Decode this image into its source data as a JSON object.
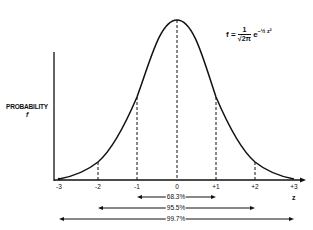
{
  "diagram": {
    "y_axis_label": "PROBABILITY",
    "y_axis_symbol": "f",
    "x_axis_symbol": "z",
    "formula": {
      "lhs": "f =",
      "numerator": "1",
      "denominator": "√2π",
      "base": "e",
      "exponent": "−½ z²"
    },
    "ticks": [
      {
        "label": "-3",
        "x": 59
      },
      {
        "label": "-2",
        "x": 98
      },
      {
        "label": "-1",
        "x": 137
      },
      {
        "label": "0",
        "x": 177
      },
      {
        "label": "+1",
        "x": 216
      },
      {
        "label": "+2",
        "x": 255
      },
      {
        "label": "+3",
        "x": 294
      }
    ],
    "ranges": [
      {
        "label": "68.3%",
        "from": "-1",
        "to": "+1"
      },
      {
        "label": "95.5%",
        "from": "-2",
        "to": "+2"
      },
      {
        "label": "99.7%",
        "from": "-3",
        "to": "+3"
      }
    ],
    "colors": {
      "ink": "#111111",
      "background": "#ffffff"
    }
  }
}
